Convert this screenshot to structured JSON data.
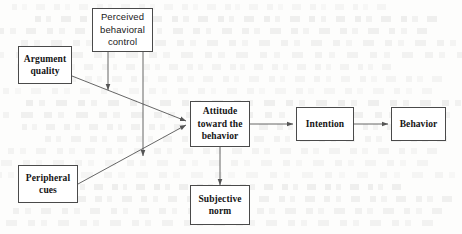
{
  "diagram": {
    "background_note": "faint scanned show-through text from reverse page",
    "line_color": "#555555",
    "box_border_color": "#4a4a4a",
    "box_fill_color": "#ffffff",
    "text_color": "#141414",
    "nodes": [
      {
        "id": "argument-quality",
        "label": "Argument\nquality",
        "x": 18,
        "y": 46,
        "w": 54,
        "h": 38,
        "font": "serif"
      },
      {
        "id": "perceived-control",
        "label": "Perceived\nbehavioral\ncontrol",
        "x": 92,
        "y": 8,
        "w": 61,
        "h": 44,
        "font": "sans"
      },
      {
        "id": "peripheral-cues",
        "label": "Peripheral\ncues",
        "x": 18,
        "y": 165,
        "w": 60,
        "h": 38,
        "font": "serif"
      },
      {
        "id": "attitude",
        "label": "Attitude\ntoward the\nbehavior",
        "x": 190,
        "y": 101,
        "w": 60,
        "h": 46,
        "font": "serif"
      },
      {
        "id": "subjective-norm",
        "label": "Subjective\nnorm",
        "x": 190,
        "y": 185,
        "w": 60,
        "h": 40,
        "font": "serif"
      },
      {
        "id": "intention",
        "label": "Intention",
        "x": 296,
        "y": 107,
        "w": 58,
        "h": 34,
        "font": "serif"
      },
      {
        "id": "behavior",
        "label": "Behavior",
        "x": 391,
        "y": 107,
        "w": 55,
        "h": 34,
        "font": "serif"
      }
    ],
    "edges": [
      {
        "id": "argument-quality-to-attitude",
        "from": "argument-quality",
        "to": "attitude",
        "style": "diagonal",
        "arrowheads": "single"
      },
      {
        "id": "peripheral-cues-to-attitude",
        "from": "peripheral-cues",
        "to": "attitude",
        "style": "diagonal",
        "arrowheads": "single"
      },
      {
        "id": "control-to-argument-path",
        "from": "perceived-control",
        "to": "argument-quality-to-attitude",
        "style": "vertical",
        "arrowheads": "single"
      },
      {
        "id": "control-to-peripheral-path",
        "from": "perceived-control",
        "to": "peripheral-cues-to-attitude",
        "style": "vertical",
        "arrowheads": "single"
      },
      {
        "id": "attitude-subjective-norm",
        "from": "attitude",
        "to": "subjective-norm",
        "style": "vertical",
        "arrowheads": "double"
      },
      {
        "id": "attitude-to-intention",
        "from": "attitude",
        "to": "intention",
        "style": "horizontal",
        "arrowheads": "single"
      },
      {
        "id": "intention-to-behavior",
        "from": "intention",
        "to": "behavior",
        "style": "horizontal",
        "arrowheads": "single"
      }
    ]
  }
}
